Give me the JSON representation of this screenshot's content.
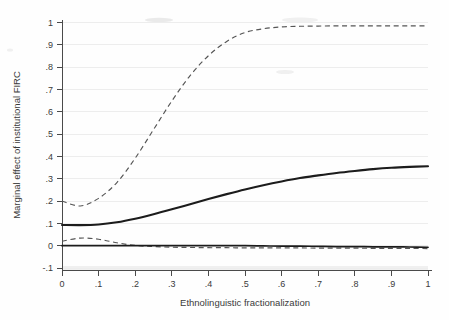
{
  "chart_data": {
    "type": "line",
    "title": "",
    "subtitle": "",
    "xlabel": "Ethnolinguistic fractionalization",
    "ylabel": "Marginal effect of institutional FIRC",
    "xlim": [
      0,
      1
    ],
    "ylim": [
      -0.1,
      1
    ],
    "xticks": [
      "0",
      ".1",
      ".2",
      ".3",
      ".4",
      ".5",
      ".6",
      ".7",
      ".8",
      ".9",
      "1"
    ],
    "xtick_values": [
      0,
      0.1,
      0.2,
      0.3,
      0.4,
      0.5,
      0.6,
      0.7,
      0.8,
      0.9,
      1
    ],
    "yticks": [
      "1",
      ".9",
      ".8",
      ".7",
      ".6",
      ".5",
      ".4",
      ".3",
      ".2",
      ".1",
      "0",
      "-.1"
    ],
    "ytick_values": [
      1,
      0.9,
      0.8,
      0.7,
      0.6,
      0.5,
      0.4,
      0.3,
      0.2,
      0.1,
      0,
      -0.1
    ],
    "grid": "horizontal",
    "legend": "none",
    "x": [
      0,
      0.05,
      0.1,
      0.15,
      0.2,
      0.25,
      0.3,
      0.35,
      0.4,
      0.45,
      0.5,
      0.55,
      0.6,
      0.65,
      0.7,
      0.75,
      0.8,
      0.85,
      0.9,
      0.95,
      1
    ],
    "series": [
      {
        "name": "Marginal effect (point estimate)",
        "style": "solid",
        "values": [
          0.093,
          0.092,
          0.095,
          0.105,
          0.121,
          0.141,
          0.163,
          0.186,
          0.209,
          0.231,
          0.252,
          0.271,
          0.288,
          0.303,
          0.315,
          0.326,
          0.335,
          0.343,
          0.349,
          0.353,
          0.356
        ]
      },
      {
        "name": "Upper confidence bound",
        "style": "dashed",
        "values": [
          0.2,
          0.178,
          0.212,
          0.283,
          0.392,
          0.52,
          0.648,
          0.762,
          0.851,
          0.915,
          0.955,
          0.972,
          0.98,
          0.983,
          0.984,
          0.985,
          0.985,
          0.985,
          0.985,
          0.985,
          0.985
        ]
      },
      {
        "name": "Lower confidence bound",
        "style": "dashed",
        "values": [
          0.02,
          0.034,
          0.029,
          0.013,
          0.001,
          -0.004,
          -0.007,
          -0.008,
          -0.009,
          -0.009,
          -0.01,
          -0.01,
          -0.01,
          -0.01,
          -0.011,
          -0.011,
          -0.011,
          -0.012,
          -0.012,
          -0.012,
          -0.013
        ]
      },
      {
        "name": "Zero reference line",
        "style": "solid-reference",
        "values": [
          0,
          0,
          0,
          0,
          0,
          0,
          0,
          0,
          0,
          0,
          0,
          -0.001,
          -0.002,
          -0.002,
          -0.003,
          -0.004,
          -0.004,
          -0.005,
          -0.005,
          -0.006,
          -0.007
        ]
      }
    ],
    "colors": {
      "estimate": "#1c1c1c",
      "confidence_bounds": "#555555",
      "grid": "#ededed",
      "axis": "#4a4a4a",
      "background": "#fefefe"
    }
  }
}
